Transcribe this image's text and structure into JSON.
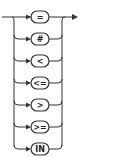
{
  "diagram": {
    "type": "railroad-syntax-diagram",
    "options": [
      {
        "label": "=",
        "y": 17
      },
      {
        "label": "#",
        "y": 39
      },
      {
        "label": "<",
        "y": 61
      },
      {
        "label": "<=",
        "y": 83
      },
      {
        "label": ">",
        "y": 105
      },
      {
        "label": ">=",
        "y": 127
      },
      {
        "label": "IN",
        "y": 149
      }
    ],
    "colors": {
      "line": "#333333",
      "background": "#ffffff"
    }
  }
}
